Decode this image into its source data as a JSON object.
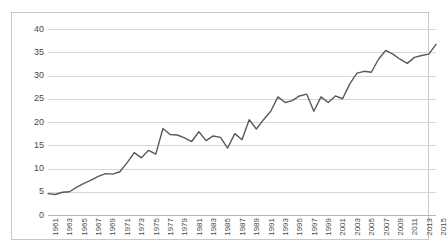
{
  "chart_data": {
    "type": "line",
    "title": "",
    "subtitle": "",
    "xlabel": "",
    "ylabel": "",
    "xlim": [
      1961,
      2015
    ],
    "ylim": [
      0,
      40
    ],
    "y_ticks": [
      0,
      5,
      10,
      15,
      20,
      25,
      30,
      35,
      40
    ],
    "y_tick_labels": [
      "0",
      "5",
      "10",
      "15",
      "20",
      "25",
      "30",
      "35",
      "40"
    ],
    "x_tick_labels": [
      "1961",
      "1963",
      "1965",
      "1967",
      "1969",
      "1971",
      "1973",
      "1975",
      "1977",
      "1979",
      "1981",
      "1983",
      "1985",
      "1987",
      "1989",
      "1991",
      "1993",
      "1995",
      "1997",
      "1999",
      "2001",
      "2003",
      "2005",
      "2007",
      "2009",
      "2011",
      "2013",
      "2015"
    ],
    "grid": "horizontal",
    "legend": "none",
    "series_color": "#595959",
    "grid_color": "#d7d7d7",
    "x": [
      1961,
      1962,
      1963,
      1964,
      1965,
      1966,
      1967,
      1968,
      1969,
      1970,
      1971,
      1972,
      1973,
      1974,
      1975,
      1976,
      1977,
      1978,
      1979,
      1980,
      1981,
      1982,
      1983,
      1984,
      1985,
      1986,
      1987,
      1988,
      1989,
      1990,
      1991,
      1992,
      1993,
      1994,
      1995,
      1996,
      1997,
      1998,
      1999,
      2000,
      2001,
      2002,
      2003,
      2004,
      2005,
      2006,
      2007,
      2008,
      2009,
      2010,
      2011,
      2012,
      2013,
      2014,
      2015
    ],
    "series": [
      {
        "name": "value",
        "values": [
          4.6,
          4.4,
          4.9,
          5.0,
          6.0,
          6.8,
          7.5,
          8.3,
          8.9,
          8.8,
          9.3,
          11.2,
          13.4,
          12.3,
          13.9,
          13.1,
          18.6,
          17.3,
          17.2,
          16.6,
          15.8,
          17.9,
          16.0,
          17.0,
          16.7,
          14.4,
          17.5,
          16.2,
          20.5,
          18.5,
          20.5,
          22.3,
          25.4,
          24.2,
          24.6,
          25.6,
          26.0,
          22.3,
          25.4,
          24.2,
          25.6,
          25.0,
          28.2,
          30.5,
          30.9,
          30.7,
          33.5,
          35.4,
          34.6,
          33.5,
          32.6,
          33.9,
          34.3,
          34.6,
          36.7
        ]
      }
    ]
  }
}
